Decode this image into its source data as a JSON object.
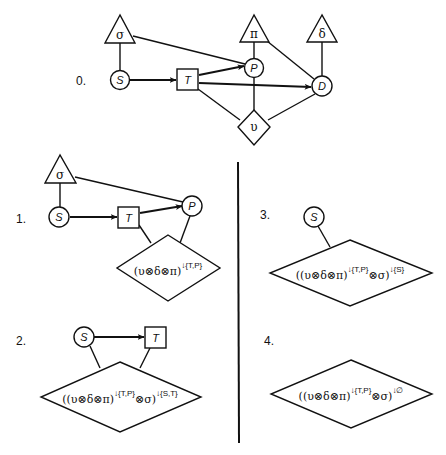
{
  "colors": {
    "ink": "#111111",
    "background": "#ffffff"
  },
  "panels": [
    {
      "id": "0",
      "label": "0.",
      "nodes": {
        "sigma": "σ",
        "pi": "π",
        "delta": "δ",
        "S": "S",
        "T": "T",
        "P": "P",
        "D": "D",
        "upsilon": "υ"
      },
      "edges": [
        {
          "from": "S",
          "to": "T",
          "directed": true
        },
        {
          "from": "T",
          "to": "P",
          "directed": true
        },
        {
          "from": "T",
          "to": "D",
          "directed": true
        },
        {
          "from": "sigma",
          "to": "S",
          "directed": false
        },
        {
          "from": "sigma",
          "to": "P",
          "directed": false
        },
        {
          "from": "pi",
          "to": "P",
          "directed": false
        },
        {
          "from": "pi",
          "to": "D",
          "directed": false
        },
        {
          "from": "delta",
          "to": "D",
          "directed": false
        },
        {
          "from": "upsilon",
          "to": "T",
          "directed": false
        },
        {
          "from": "upsilon",
          "to": "P",
          "directed": false
        },
        {
          "from": "upsilon",
          "to": "D",
          "directed": false
        }
      ]
    },
    {
      "id": "1",
      "label": "1.",
      "nodes": {
        "sigma": "σ",
        "S": "S",
        "T": "T",
        "P": "P"
      },
      "potential": {
        "base": "(υ⊗δ⊗π)",
        "sup1": "↓{T,P}"
      }
    },
    {
      "id": "2",
      "label": "2.",
      "nodes": {
        "S": "S",
        "T": "T"
      },
      "potential": {
        "base": "((υ⊗δ⊗π)",
        "sup1": "↓{T,P}",
        "mid": "⊗σ)",
        "sup2": "↓{S,T}"
      }
    },
    {
      "id": "3",
      "label": "3.",
      "nodes": {
        "S": "S"
      },
      "potential": {
        "base": "((υ⊗δ⊗π)",
        "sup1": "↓{T,P}",
        "mid": "⊗σ)",
        "sup2": "↓{S}"
      }
    },
    {
      "id": "4",
      "label": "4.",
      "nodes": {},
      "potential": {
        "base": "((υ⊗δ⊗π)",
        "sup1": "↓{T,P}",
        "mid": "⊗σ)",
        "sup2": "↓∅"
      }
    }
  ]
}
